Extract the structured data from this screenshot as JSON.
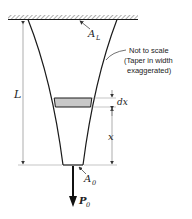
{
  "diagram": {
    "labels": {
      "top_area": "A",
      "top_area_sub": "L",
      "bottom_area": "A",
      "bottom_area_sub": "0",
      "length": "L",
      "element_thickness": "dx",
      "position": "x",
      "load": "P",
      "load_sub": "0"
    },
    "note": {
      "line1": "Not to scale",
      "line2": "(Taper in width",
      "line3": "exaggerated)"
    },
    "colors": {
      "stroke": "#1a1a1a",
      "element_fill": "#c8c8c8",
      "hatch": "#777777",
      "dim_line": "#555555"
    }
  }
}
